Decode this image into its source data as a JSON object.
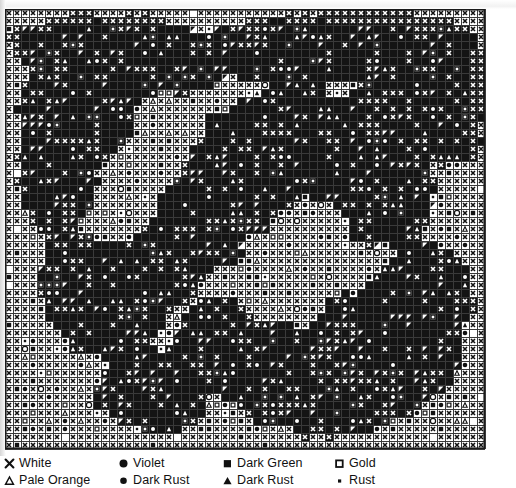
{
  "document": {
    "type": "cross-stitch pattern chart",
    "title": "Cross Stitch Pattern Chart"
  },
  "chart_data": {
    "type": "heatmap",
    "xlabel": "",
    "ylabel": "",
    "grid": true,
    "columns": 60,
    "rows": 55,
    "cell_px": 8,
    "symbols": [
      {
        "key": "X",
        "name": "cross-x",
        "color_label": "White"
      },
      {
        "key": "T",
        "name": "triangle-open",
        "color_label": "Pale Orange"
      },
      {
        "key": "O",
        "name": "circle-filled",
        "color_label": "Violet"
      },
      {
        "key": "o",
        "name": "circle-small-filled",
        "color_label": "Dark Rust"
      },
      {
        "key": "S",
        "name": "square-filled",
        "color_label": "Dark Green"
      },
      {
        "key": "A",
        "name": "triangle-filled",
        "color_label": "Dark Rust"
      },
      {
        "key": "G",
        "name": "square-open",
        "color_label": "Gold"
      },
      {
        "key": "D",
        "name": "dot-small",
        "color_label": "Rust"
      },
      {
        "key": "B",
        "name": "block-solid",
        "color_label": "Background Fill"
      },
      {
        "key": ".",
        "name": "empty-cell",
        "color_label": "Unstitched"
      }
    ],
    "legend_position": "bottom",
    "note": "Dense floral needlepoint chart; each grid cell carries one stitch symbol."
  },
  "legend": {
    "rows": [
      [
        {
          "symbol": "cross-x",
          "label": "White"
        },
        {
          "symbol": "circle-filled",
          "label": "Violet"
        },
        {
          "symbol": "square-filled",
          "label": "Dark Green"
        },
        {
          "symbol": "square-open",
          "label": "Gold"
        }
      ],
      [
        {
          "symbol": "triangle-open",
          "label": "Pale Orange"
        },
        {
          "symbol": "circle-small-filled",
          "label": "Dark Rust"
        },
        {
          "symbol": "triangle-filled",
          "label": "Dark Rust"
        },
        {
          "symbol": "dot-small",
          "label": "Rust"
        }
      ]
    ],
    "column_x": [
      4,
      118,
      222,
      334
    ]
  },
  "colors": {
    "ink": "#111111",
    "grid_line": "#3a3a3a",
    "paper": "#ffffff",
    "fill_dark": "#141414"
  }
}
